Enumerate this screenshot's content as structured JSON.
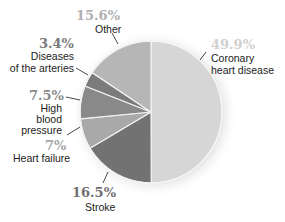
{
  "chart_data": {
    "type": "pie",
    "title": "",
    "start_angle_deg": 0,
    "direction": "clockwise",
    "slices": [
      {
        "label": "Coronary heart disease",
        "value": 49.9,
        "pct_label": "49.9%",
        "color": "#d6d6d6",
        "pct_color": "#d0d0d0"
      },
      {
        "label": "Stroke",
        "value": 16.5,
        "pct_label": "16.5%",
        "color": "#727272",
        "pct_color": "#707070"
      },
      {
        "label": "Heart failure",
        "value": 7.0,
        "pct_label": "7%",
        "color": "#a9a9a9",
        "pct_color": "#a5a5a5"
      },
      {
        "label": "High blood pressure",
        "value": 7.5,
        "pct_label": "7.5%",
        "color": "#898989",
        "pct_color": "#8a8a8a"
      },
      {
        "label": "Diseases of the arteries",
        "value": 3.4,
        "pct_label": "3.4%",
        "color": "#7b7b7b",
        "pct_color": "#7a7a7a"
      },
      {
        "label": "Other",
        "value": 15.6,
        "pct_label": "15.6%",
        "color": "#b6b6b6",
        "pct_color": "#b0b0b0"
      }
    ],
    "legend": "none (direct labels with leader lines)"
  },
  "labels": {
    "coronary": {
      "pct": "49.9%",
      "text1": "Coronary",
      "text2": "heart disease"
    },
    "stroke": {
      "pct": "16.5%",
      "text1": "Stroke"
    },
    "heart_failure": {
      "pct": "7%",
      "text1": "Heart failure"
    },
    "hbp": {
      "pct": "7.5%",
      "text1": "High",
      "text2": "blood",
      "text3": "pressure"
    },
    "arteries": {
      "pct": "3.4%",
      "text1": "Diseases",
      "text2": "of the arteries"
    },
    "other": {
      "pct": "15.6%",
      "text1": "Other"
    }
  }
}
